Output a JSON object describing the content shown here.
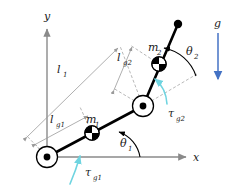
{
  "axes": {
    "x_label": "x",
    "y_label": "y",
    "origin_label": ""
  },
  "links": [
    {
      "name": "link-1",
      "length_label": "l",
      "length_sub": "1",
      "com_label": "l",
      "com_sub": "g1",
      "mass_label": "m",
      "mass_sub": "1",
      "angle_label": "θ",
      "angle_sub": "1",
      "torque_label": "τ",
      "torque_sub": "g1"
    },
    {
      "name": "link-2",
      "length_label": "l",
      "length_sub": "2",
      "com_label": "l",
      "com_sub": "g2",
      "mass_label": "m",
      "mass_sub": "2",
      "angle_label": "θ",
      "angle_sub": "2",
      "torque_label": "τ",
      "torque_sub": "g2"
    }
  ],
  "labels": {
    "l1": "l",
    "l1_sub": "1",
    "lg1": "l",
    "lg1_sub": "g1",
    "lg2": "l",
    "lg2_sub": "g2",
    "m1": "m",
    "m1_sub": "1",
    "m2": "m",
    "m2_sub": "2",
    "theta1": "θ",
    "theta1_sub": "1",
    "theta2": "θ",
    "theta2_sub": "2",
    "tau_g1": "τ",
    "tau_g1_sub": "g1",
    "tau_g2": "τ",
    "tau_g2_sub": "g2",
    "gravity": "g",
    "x_axis": "x",
    "y_axis": "y"
  },
  "colors": {
    "link": "#000000",
    "axis": "#8a8a8a",
    "dimension": "#9a9a9a",
    "torque_arrow": "#6fd4e0",
    "gravity_arrow": "#4472c4",
    "text": "#1a1a1a",
    "background": "#ffffff"
  },
  "geometry": {
    "base_joint": [
      47,
      157
    ],
    "elbow_joint": [
      143,
      106
    ],
    "tip": [
      178,
      24
    ],
    "com1": [
      92,
      133
    ],
    "com2": [
      159,
      64
    ],
    "x_axis_end": [
      190,
      157
    ],
    "y_axis_top": [
      47,
      26
    ],
    "gravity_arrow_top": [
      218,
      33
    ],
    "gravity_arrow_bottom": [
      218,
      82
    ]
  }
}
